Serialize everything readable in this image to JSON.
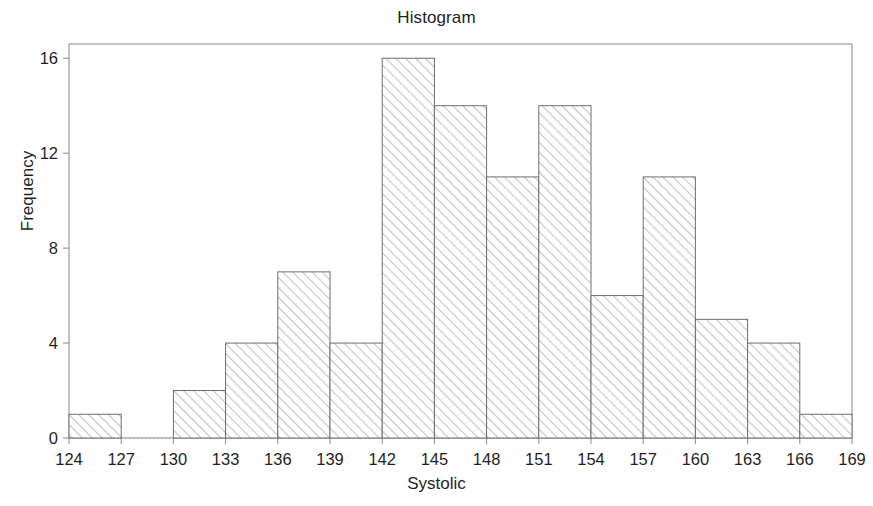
{
  "chart_data": {
    "type": "bar",
    "title": "Histogram",
    "xlabel": "Systolic",
    "ylabel": "Frequency",
    "bin_width": 3,
    "bin_edges": [
      124,
      127,
      130,
      133,
      136,
      139,
      142,
      145,
      148,
      151,
      154,
      157,
      160,
      163,
      166,
      169
    ],
    "categories": [
      "124-127",
      "127-130",
      "130-133",
      "133-136",
      "136-139",
      "139-142",
      "142-145",
      "145-148",
      "148-151",
      "151-154",
      "154-157",
      "157-160",
      "160-163",
      "163-166",
      "166-169"
    ],
    "values": [
      1,
      0,
      2,
      4,
      7,
      4,
      16,
      14,
      11,
      14,
      6,
      11,
      5,
      4,
      1
    ],
    "xlim": [
      124,
      169
    ],
    "ylim": [
      0,
      16.6
    ],
    "xticks": [
      124,
      127,
      130,
      133,
      136,
      139,
      142,
      145,
      148,
      151,
      154,
      157,
      160,
      163,
      166,
      169
    ],
    "xtick_labels": [
      "124",
      "127",
      "130",
      "133",
      "136",
      "139",
      "142",
      "145",
      "148",
      "151",
      "154",
      "157",
      "160",
      "163",
      "166",
      "169"
    ],
    "yticks": [
      0,
      4,
      8,
      12,
      16
    ],
    "ytick_labels": [
      "0",
      "4",
      "8",
      "12",
      "16"
    ],
    "grid": false,
    "legend": null,
    "bar_fill": "diagonal-hatch",
    "bar_fill_color": "#c9c9c9",
    "bar_edge_color": "#6e6e6e",
    "axis_color": "#7a7a7a",
    "text_color": "#1f1f1f",
    "background": "#ffffff"
  },
  "figure": {
    "plot_left": 69,
    "plot_right": 852,
    "plot_top": 44,
    "plot_bottom": 438
  }
}
